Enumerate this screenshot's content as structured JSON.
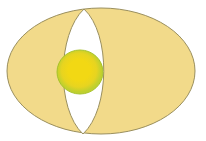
{
  "canvas": {
    "width": 206,
    "height": 141,
    "background": "#ffffff",
    "title": "egg-diagram"
  },
  "chart_data": {
    "type": "diagram",
    "title": "",
    "shapes": [
      {
        "name": "outer-ellipse",
        "role": "egg-white-outer-body",
        "geometry": "ellipse",
        "cx": 101,
        "cy": 71,
        "rx": 94,
        "ry": 63,
        "fill": "#F2DA8A",
        "stroke": "#9A8F5E",
        "stroke_width": 1
      },
      {
        "name": "lens-vesica",
        "role": "egg-white-inner-lens",
        "geometry": "vesica-piscis",
        "apex_top_x": 84,
        "apex_top_y": 9,
        "apex_bottom_x": 83,
        "apex_bottom_y": 134,
        "half_width": 27,
        "center_x": 83,
        "center_y": 71,
        "fill": "#FFFFFF",
        "stroke": "#9A8F5E",
        "stroke_width": 1
      },
      {
        "name": "yolk-circle",
        "role": "egg-yolk",
        "geometry": "ellipse",
        "cx": 80,
        "cy": 72,
        "rx": 23,
        "ry": 22,
        "fill_center": "#F2D814",
        "fill_rim": "#BFD02E",
        "stroke": "#A8C22A",
        "stroke_width": 1
      }
    ],
    "colors": {
      "outer_fill": "#F2DA8A",
      "outline": "#9A8F5E",
      "lens_fill": "#FFFFFF",
      "yolk_center": "#F2D814",
      "yolk_rim": "#BFD02E",
      "background": "#FFFFFF"
    },
    "labels": [],
    "legend": [],
    "annotations": []
  }
}
